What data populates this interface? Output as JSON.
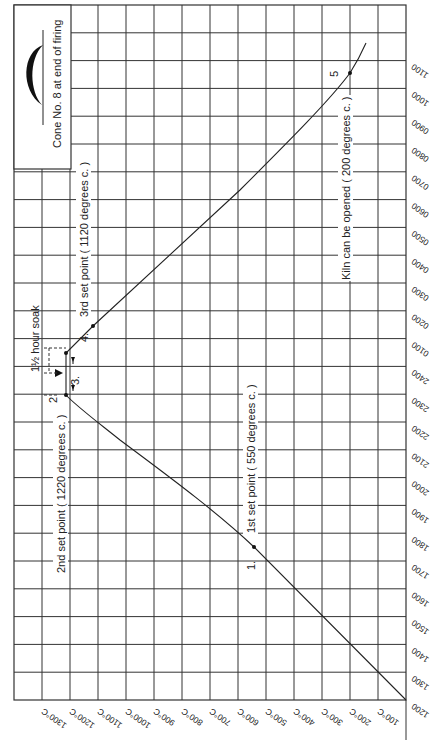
{
  "chart_data": {
    "type": "line",
    "orientation": "rotated 90° clockwise (time runs bottom→top on right edge, temperature runs right→left along bottom)",
    "xlabel": "Time of day (24h clock)",
    "ylabel": "Temperature (°C)",
    "grid": true,
    "time_ticks": [
      "1200",
      "1300",
      "1400",
      "1500",
      "1600",
      "1700",
      "1800",
      "1900",
      "2000",
      "2100",
      "2200",
      "2300",
      "2400",
      "0100",
      "0200",
      "0300",
      "0400",
      "0500",
      "0600",
      "0700",
      "0800",
      "0900",
      "1000",
      "1100"
    ],
    "temperature_ticks": [
      "100°C",
      "200°C",
      "300°C",
      "400°C",
      "500°C",
      "600°C",
      "700°C",
      "800°C",
      "900°C",
      "1000°C",
      "1100°C",
      "1200°C",
      "1300°C"
    ],
    "ylim": [
      0,
      1350
    ],
    "series": [
      {
        "name": "Firing curve",
        "points": [
          {
            "time": "1200",
            "temp": 0
          },
          {
            "time": "1300",
            "temp": 100
          },
          {
            "time": "1400",
            "temp": 200
          },
          {
            "time": "1500",
            "temp": 300
          },
          {
            "time": "1600",
            "temp": 400
          },
          {
            "time": "1700",
            "temp": 500
          },
          {
            "time": "1730",
            "temp": 550
          },
          {
            "time": "1900",
            "temp": 810
          },
          {
            "time": "2000",
            "temp": 960
          },
          {
            "time": "2100",
            "temp": 1080
          },
          {
            "time": "2200",
            "temp": 1170
          },
          {
            "time": "2300",
            "temp": 1220
          },
          {
            "time": "0030",
            "temp": 1220
          },
          {
            "time": "0127",
            "temp": 1120
          },
          {
            "time": "0300",
            "temp": 990
          },
          {
            "time": "0500",
            "temp": 790
          },
          {
            "time": "0700",
            "temp": 560
          },
          {
            "time": "0900",
            "temp": 340
          },
          {
            "time": "1033",
            "temp": 200
          },
          {
            "time": "1140",
            "temp": 150
          }
        ]
      }
    ],
    "markers": [
      {
        "id": "1.",
        "time": "1730",
        "temp": 550,
        "label": "1st set point ( 550 degrees c. )"
      },
      {
        "id": "2",
        "time": "2300",
        "temp": 1220,
        "label": "2nd set point ( 1220 degrees c. )"
      },
      {
        "id": "3.",
        "time": "0030",
        "temp": 1220,
        "label": "1½ hour soak"
      },
      {
        "id": "4.",
        "time": "0127",
        "temp": 1120,
        "label": "3rd set point ( 1120 degrees c. )"
      },
      {
        "id": "5",
        "time": "1033",
        "temp": 200,
        "label": "Kiln can be opened ( 200 degrees c. )"
      }
    ],
    "annotations": [
      "Cone  No. 8 at end of firing"
    ]
  },
  "labels": {
    "cone": "Cone  No. 8 at end of firing",
    "soak": "1½ hour soak",
    "sp1": "1st set point ( 550 degrees c. )",
    "sp2": "2nd set point ( 1220 degrees c. )",
    "sp3": "3rd set point ( 1120 degrees c. )",
    "open": "Kiln can be opened ( 200 degrees c. )",
    "m1": "1.",
    "m2": "2",
    "m3": "3.",
    "m4": "4.",
    "m5": "5"
  }
}
